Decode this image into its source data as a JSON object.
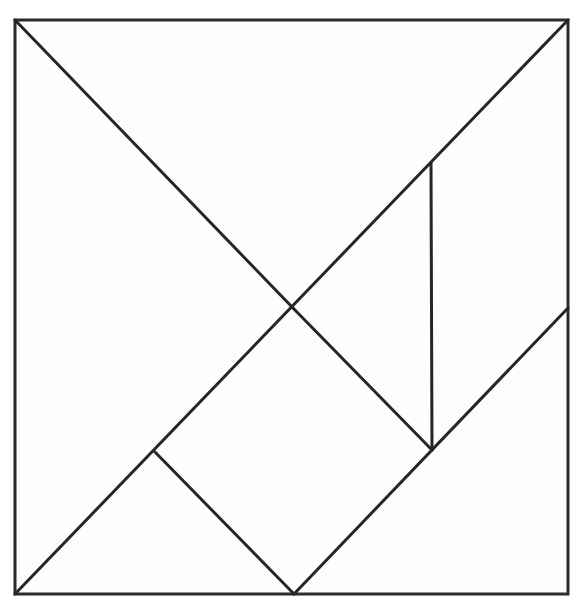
{
  "diagram": {
    "type": "tangram",
    "background": "#ffffff",
    "stroke_color": "#262626",
    "fill_color": "#fdfdfd",
    "frame": {
      "x1": 15,
      "y1": 20,
      "x2": 568,
      "y2": 594
    },
    "vertices": {
      "top_left": [
        15,
        20
      ],
      "top_right": [
        568,
        20
      ],
      "bottom_left": [
        15,
        594
      ],
      "bottom_right": [
        568,
        594
      ],
      "center": [
        293,
        308
      ],
      "vertical_top": [
        431,
        163
      ],
      "vertical_bottom": [
        432,
        450
      ],
      "right_mid": [
        568,
        308
      ],
      "left_inner": [
        155,
        452
      ],
      "bottom_mid": [
        294,
        594
      ]
    },
    "pieces": [
      {
        "name": "large-triangle-left",
        "points": [
          [
            15,
            20
          ],
          [
            293,
            308
          ],
          [
            15,
            594
          ]
        ]
      },
      {
        "name": "large-triangle-top",
        "points": [
          [
            15,
            20
          ],
          [
            568,
            20
          ],
          [
            293,
            308
          ]
        ]
      },
      {
        "name": "parallelogram-right",
        "points": [
          [
            568,
            20
          ],
          [
            568,
            308
          ],
          [
            432,
            450
          ],
          [
            431,
            163
          ]
        ]
      },
      {
        "name": "small-triangle-center-right",
        "points": [
          [
            293,
            308
          ],
          [
            431,
            163
          ],
          [
            432,
            450
          ]
        ]
      },
      {
        "name": "square-center",
        "points": [
          [
            293,
            308
          ],
          [
            432,
            450
          ],
          [
            294,
            594
          ],
          [
            155,
            452
          ]
        ]
      },
      {
        "name": "small-triangle-bottom-left",
        "points": [
          [
            15,
            594
          ],
          [
            155,
            452
          ],
          [
            294,
            594
          ]
        ]
      },
      {
        "name": "medium-triangle-bottom-right",
        "points": [
          [
            294,
            594
          ],
          [
            568,
            308
          ],
          [
            568,
            594
          ]
        ]
      }
    ]
  }
}
